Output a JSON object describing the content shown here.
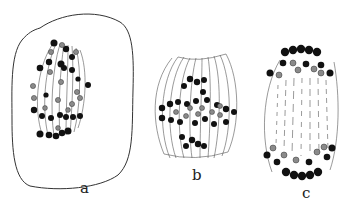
{
  "figure": {
    "colors": {
      "outline": "#333333",
      "spindle_fiber": "#555555",
      "chromosome_dark": "#111111",
      "chromosome_gray": "#8a8a8a",
      "background": "#ffffff"
    },
    "panels": [
      {
        "id": "a",
        "label": "a",
        "content": "cell outline with spindle and scattered chromosomes"
      },
      {
        "id": "b",
        "label": "b",
        "content": "barrel spindle with chromosomes at equatorial plate"
      },
      {
        "id": "c",
        "label": "c",
        "content": "oval spindle with chromosomes at both poles"
      }
    ]
  }
}
